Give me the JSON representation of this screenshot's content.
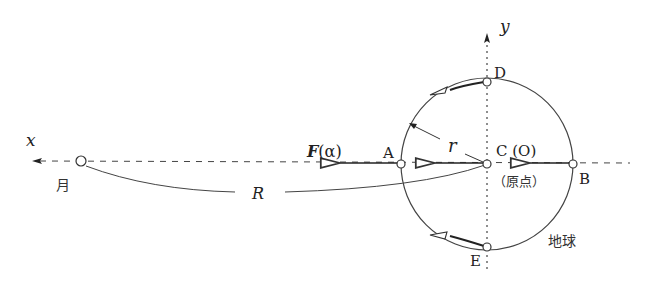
{
  "diagram": {
    "axes": {
      "x_label": "x",
      "y_label": "y"
    },
    "points": {
      "A": "A",
      "B": "B",
      "C": "C (O)",
      "D": "D",
      "E": "E"
    },
    "origin_note": "（原点）",
    "moon_label": "月",
    "earth_label": "地球",
    "force_label_symbol": "F",
    "force_label_arg": "(α)",
    "radius_label": "r",
    "distance_label": "R",
    "colors": {
      "line": "#333333",
      "background": "#ffffff"
    }
  }
}
